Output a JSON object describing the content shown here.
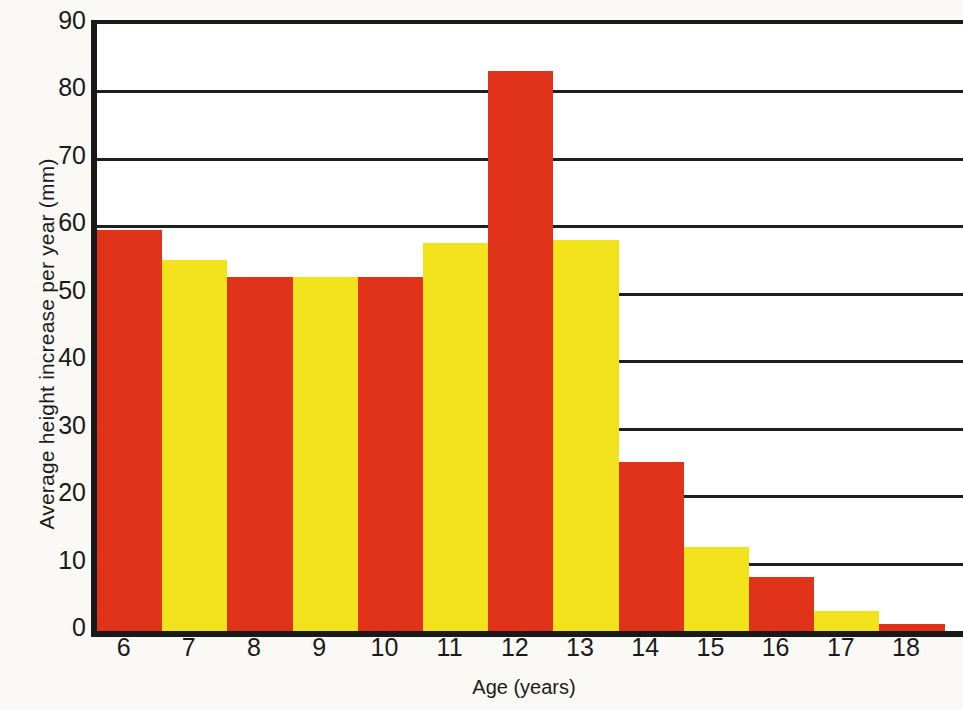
{
  "chart_data": {
    "type": "bar",
    "title": "",
    "subtitle": "",
    "xlabel": "Age (years)",
    "ylabel": "Average height increase per year (mm)",
    "categories": [
      "6",
      "7",
      "8",
      "9",
      "10",
      "11",
      "12",
      "13",
      "14",
      "15",
      "16",
      "17",
      "18"
    ],
    "values": [
      59.5,
      55,
      52.5,
      52.5,
      52.5,
      57.5,
      83,
      58,
      25,
      12.5,
      8,
      3,
      1
    ],
    "bar_colors": [
      "#e0331a",
      "#f2e31c",
      "#e0331a",
      "#f2e31c",
      "#e0331a",
      "#f2e31c",
      "#e0331a",
      "#f2e31c",
      "#e0331a",
      "#f2e31c",
      "#e0331a",
      "#f2e31c",
      "#e0331a"
    ],
    "ylim": [
      0,
      90
    ],
    "xlim": [
      6,
      19
    ],
    "ytick_labels": [
      "0",
      "10",
      "20",
      "30",
      "40",
      "50",
      "60",
      "70",
      "80",
      "90"
    ],
    "ytick_values": [
      0,
      10,
      20,
      30,
      40,
      50,
      60,
      70,
      80,
      90
    ],
    "grid": true,
    "grid_axis": "y",
    "legend": false,
    "legend_position": "none",
    "bar_gap": 0,
    "colors": {
      "red": "#e0331a",
      "yellow": "#f2e31c",
      "axis": "#1a1a1a",
      "gridline": "#1f1f1f",
      "plot_background": "#ffffff",
      "page_background": "#faf9f5",
      "text": "#1a1a1a"
    }
  }
}
